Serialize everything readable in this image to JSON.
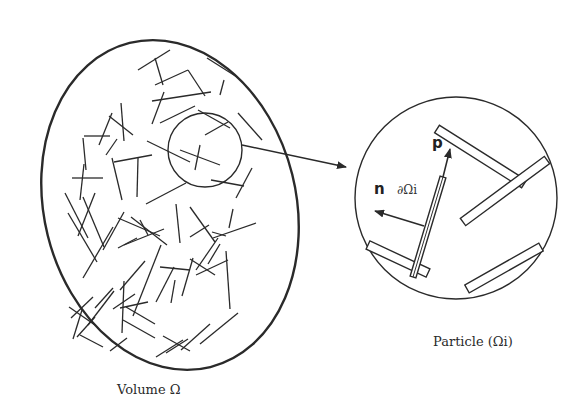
{
  "figure": {
    "volume_caption": "Volume Ω",
    "particle_caption": "Particle (Ωi)",
    "vector_p_label": "p",
    "vector_n_label": "n",
    "boundary_label": "∂Ωi",
    "stroke_color": "#2a2a2a"
  },
  "volume": {
    "ellipse": {
      "cx": 170,
      "cy": 205,
      "rx": 126,
      "ry": 167,
      "rotate": -14
    },
    "zoom_circle": {
      "cx": 205,
      "cy": 150,
      "r": 37
    },
    "fibers": [
      [
        138,
        70,
        170,
        50
      ],
      [
        155,
        58,
        163,
        85
      ],
      [
        155,
        85,
        188,
        70
      ],
      [
        188,
        70,
        205,
        96
      ],
      [
        207,
        58,
        237,
        77
      ],
      [
        224,
        80,
        220,
        95
      ],
      [
        152,
        101,
        211,
        92
      ],
      [
        164,
        92,
        152,
        124
      ],
      [
        160,
        123,
        195,
        106
      ],
      [
        133,
        135,
        109,
        116
      ],
      [
        121,
        103,
        124,
        141
      ],
      [
        99,
        145,
        112,
        113
      ],
      [
        83,
        138,
        86,
        170
      ],
      [
        84,
        136,
        110,
        136
      ],
      [
        117,
        139,
        106,
        155
      ],
      [
        198,
        110,
        230,
        128
      ],
      [
        238,
        113,
        262,
        140
      ],
      [
        228,
        122,
        205,
        135
      ],
      [
        200,
        145,
        195,
        170
      ],
      [
        180,
        150,
        220,
        165
      ],
      [
        147,
        141,
        190,
        162
      ],
      [
        186,
        183,
        146,
        204
      ],
      [
        211,
        180,
        244,
        186
      ],
      [
        252,
        168,
        236,
        198
      ],
      [
        114,
        162,
        152,
        155
      ],
      [
        138,
        158,
        137,
        197
      ],
      [
        112,
        158,
        122,
        200
      ],
      [
        72,
        178,
        103,
        178
      ],
      [
        84,
        164,
        80,
        200
      ],
      [
        65,
        193,
        88,
        238
      ],
      [
        83,
        197,
        104,
        247
      ],
      [
        68,
        213,
        97,
        262
      ],
      [
        113,
        227,
        83,
        278
      ],
      [
        95,
        193,
        78,
        236
      ],
      [
        124,
        212,
        103,
        250
      ],
      [
        118,
        248,
        137,
        238
      ],
      [
        118,
        218,
        160,
        236
      ],
      [
        131,
        217,
        167,
        245
      ],
      [
        140,
        220,
        148,
        235
      ],
      [
        164,
        229,
        124,
        245
      ],
      [
        176,
        204,
        180,
        243
      ],
      [
        190,
        207,
        215,
        242
      ],
      [
        190,
        237,
        209,
        225
      ],
      [
        218,
        238,
        196,
        270
      ],
      [
        213,
        238,
        256,
        223
      ],
      [
        233,
        209,
        229,
        228
      ],
      [
        212,
        232,
        226,
        236
      ],
      [
        190,
        259,
        215,
        275
      ],
      [
        226,
        251,
        230,
        309
      ],
      [
        220,
        244,
        208,
        264
      ],
      [
        160,
        267,
        190,
        270
      ],
      [
        193,
        258,
        182,
        296
      ],
      [
        174,
        267,
        156,
        302
      ],
      [
        161,
        245,
        133,
        316
      ],
      [
        145,
        261,
        120,
        290
      ],
      [
        114,
        291,
        88,
        325
      ],
      [
        135,
        294,
        113,
        309
      ],
      [
        124,
        281,
        122,
        333
      ],
      [
        120,
        308,
        148,
        302
      ],
      [
        126,
        307,
        155,
        324
      ],
      [
        113,
        288,
        95,
        308
      ],
      [
        93,
        297,
        71,
        318
      ],
      [
        69,
        307,
        95,
        325
      ],
      [
        82,
        310,
        73,
        339
      ],
      [
        95,
        317,
        77,
        337
      ],
      [
        80,
        335,
        103,
        347
      ],
      [
        110,
        351,
        127,
        338
      ],
      [
        123,
        320,
        155,
        338
      ],
      [
        163,
        336,
        190,
        351
      ],
      [
        166,
        353,
        188,
        339
      ],
      [
        156,
        357,
        183,
        340
      ],
      [
        181,
        350,
        210,
        324
      ],
      [
        200,
        344,
        238,
        313
      ],
      [
        196,
        275,
        228,
        260
      ],
      [
        175,
        280,
        171,
        303
      ]
    ]
  },
  "particle": {
    "circle": {
      "cx": 456,
      "cy": 198,
      "r": 101
    },
    "rods": [
      {
        "x1": 437,
        "y1": 129,
        "x2": 524,
        "y2": 184,
        "w": 9
      },
      {
        "x1": 463,
        "y1": 222,
        "x2": 547,
        "y2": 160,
        "w": 9
      },
      {
        "x1": 368,
        "y1": 245,
        "x2": 428,
        "y2": 273,
        "w": 9
      },
      {
        "x1": 467,
        "y1": 289,
        "x2": 541,
        "y2": 247,
        "w": 9
      },
      {
        "x1": 413,
        "y1": 277,
        "x2": 443,
        "y2": 177,
        "w": 6,
        "double": true
      }
    ],
    "vector_p": {
      "x1": 443,
      "y1": 177,
      "x2": 450,
      "y2": 149
    },
    "vector_n": {
      "x1": 424,
      "y1": 226,
      "x2": 375,
      "y2": 211
    }
  },
  "connector_arrow": {
    "x1": 242,
    "y1": 145,
    "x2": 346,
    "y2": 167
  }
}
